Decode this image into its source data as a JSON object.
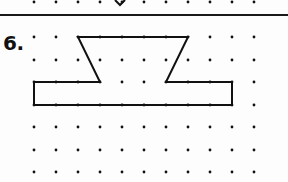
{
  "problem": {
    "number_label": "6."
  },
  "grid": {
    "columns_x": [
      34,
      56,
      78,
      100,
      122,
      144,
      166,
      188,
      210,
      232,
      254
    ],
    "rows_y": [
      37,
      60,
      82,
      105,
      127,
      150,
      172
    ],
    "previous_row_y": 2,
    "dot_color": "#111111",
    "dot_radius": 1.4
  },
  "previous_problem_fragment": {
    "points": "115,0 120,5 125,0"
  },
  "figure": {
    "stroke_color": "#111111",
    "vertices": [
      [
        78,
        37
      ],
      [
        188,
        37
      ],
      [
        166,
        82
      ],
      [
        232,
        82
      ],
      [
        232,
        105
      ],
      [
        34,
        105
      ],
      [
        34,
        82
      ],
      [
        100,
        82
      ]
    ]
  },
  "colors": {
    "background": "#fdfdfd",
    "ink": "#111111",
    "rule": "#1a1a1a"
  }
}
